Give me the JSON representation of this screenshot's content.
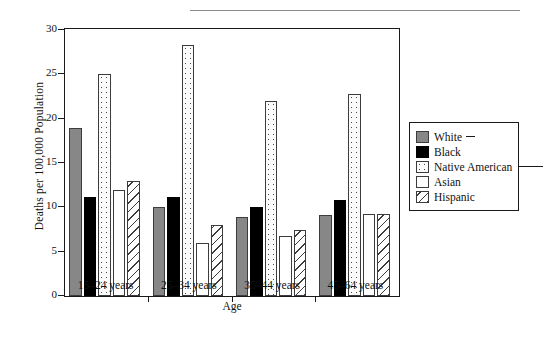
{
  "chart_data": {
    "type": "bar",
    "title": "",
    "xlabel": "Age",
    "ylabel": "Deaths per 100,000 Population",
    "categories": [
      "15–24 years",
      "25–34 years",
      "35–44 years",
      "45–64 years"
    ],
    "ylim": [
      0,
      30
    ],
    "yticks": [
      0,
      5,
      10,
      15,
      20,
      25,
      30
    ],
    "grid": false,
    "legend_position": "right",
    "series": [
      {
        "name": "White",
        "color": "#878787",
        "pattern": "solid-gray",
        "values": [
          19.0,
          10.0,
          8.9,
          9.1
        ]
      },
      {
        "name": "Black",
        "color": "#000000",
        "pattern": "solid-black",
        "values": [
          11.2,
          11.2,
          10.0,
          10.8
        ]
      },
      {
        "name": "Native American",
        "color": "#fbfbfb",
        "pattern": "dotted",
        "values": [
          25.0,
          28.3,
          22.0,
          22.8
        ]
      },
      {
        "name": "Asian",
        "color": "#ffffff",
        "pattern": "blank",
        "values": [
          12.0,
          6.0,
          6.8,
          9.2
        ]
      },
      {
        "name": "Hispanic",
        "color": "#ffffff",
        "pattern": "diagonal",
        "values": [
          13.0,
          8.0,
          7.5,
          9.2
        ]
      }
    ]
  },
  "legend": {
    "items": [
      {
        "label": "White"
      },
      {
        "label": "Black"
      },
      {
        "label": "Native American"
      },
      {
        "label": "Asian"
      },
      {
        "label": "Hispanic"
      }
    ]
  }
}
